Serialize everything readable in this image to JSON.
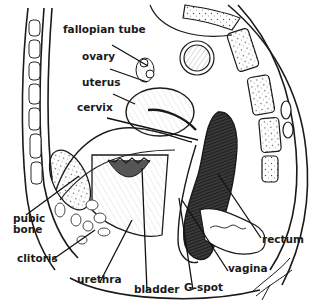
{
  "diagram": {
    "colors": {
      "ink": "#1a1a1a",
      "background": "#ffffff",
      "shading": "#8a8a8a"
    },
    "labels": [
      {
        "id": "fallopian-tube",
        "text": "fallopian tube",
        "x": 63,
        "y": 33
      },
      {
        "id": "ovary",
        "text": "ovary",
        "x": 82,
        "y": 60
      },
      {
        "id": "uterus",
        "text": "uterus",
        "x": 82,
        "y": 86
      },
      {
        "id": "cervix",
        "text": "cervix",
        "x": 77,
        "y": 111
      },
      {
        "id": "pubic-bone",
        "text": "pubic\nbone",
        "x": 13,
        "y": 222
      },
      {
        "id": "clitoris",
        "text": "clitoris",
        "x": 17,
        "y": 262
      },
      {
        "id": "urethra",
        "text": "urethra",
        "x": 77,
        "y": 283
      },
      {
        "id": "bladder",
        "text": "bladder",
        "x": 134,
        "y": 293
      },
      {
        "id": "g-spot",
        "text": "G-spot",
        "x": 184,
        "y": 291
      },
      {
        "id": "rectum",
        "text": "rectum",
        "x": 262,
        "y": 243
      },
      {
        "id": "vagina",
        "text": "vagina",
        "x": 228,
        "y": 272
      }
    ],
    "leader_lines": [
      {
        "label": "fallopian-tube",
        "x1": 112,
        "y1": 45,
        "x2": 148,
        "y2": 66
      },
      {
        "label": "ovary",
        "x1": 110,
        "y1": 69,
        "x2": 147,
        "y2": 82
      },
      {
        "label": "uterus",
        "x1": 113,
        "y1": 94,
        "x2": 135,
        "y2": 104
      },
      {
        "label": "cervix",
        "x1": 107,
        "y1": 118,
        "x2": 198,
        "y2": 140
      },
      {
        "label": "pubic-bone",
        "x1": 26,
        "y1": 215,
        "x2": 79,
        "y2": 176
      },
      {
        "label": "clitoris",
        "x1": 52,
        "y1": 260,
        "x2": 95,
        "y2": 230
      },
      {
        "label": "urethra",
        "x1": 100,
        "y1": 282,
        "x2": 132,
        "y2": 220
      },
      {
        "label": "bladder",
        "x1": 147,
        "y1": 291,
        "x2": 142,
        "y2": 168
      },
      {
        "label": "g-spot",
        "x1": 193,
        "y1": 290,
        "x2": 179,
        "y2": 198
      },
      {
        "label": "rectum",
        "x1": 261,
        "y1": 238,
        "x2": 218,
        "y2": 174
      },
      {
        "label": "vagina",
        "x1": 228,
        "y1": 271,
        "x2": 182,
        "y2": 200
      }
    ]
  }
}
